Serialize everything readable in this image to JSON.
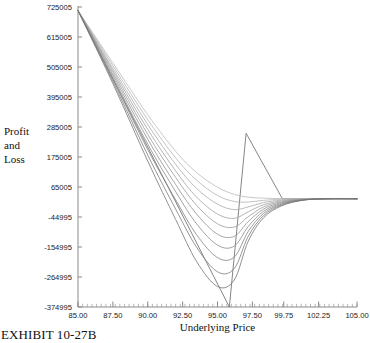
{
  "figure": {
    "exhibit_label": "EXHIBIT 10-27B"
  },
  "chart_data": {
    "type": "line",
    "title": "",
    "xlabel": "Underlying Price",
    "ylabel": "Profit and Loss",
    "ylabel_lines": [
      "Profit",
      "and",
      "Loss"
    ],
    "grid": false,
    "legend": "none",
    "xlim": [
      85.0,
      105.0
    ],
    "ylim": [
      -374995,
      725005
    ],
    "xticks": [
      85.0,
      87.5,
      90.0,
      92.5,
      95.0,
      97.5,
      99.75,
      102.25,
      105.0
    ],
    "xtick_labels": [
      "85.00",
      "87.50",
      "90.00",
      "92.50",
      "95.00",
      "97.50",
      "99.75",
      "102.25",
      "105.00"
    ],
    "yticks": [
      725005,
      615005,
      505005,
      395005,
      285005,
      175005,
      65005,
      -44995,
      -154995,
      -264995,
      -374995
    ],
    "ytick_labels": [
      "725005",
      "615005",
      "505005",
      "395005",
      "285005",
      "175005",
      "65005",
      "-44995",
      "-154995",
      "-264995",
      "-374995"
    ],
    "series": [
      {
        "name": "expiration-payoff",
        "kind": "expiration",
        "color": "#6f6f6f",
        "x": [
          85.0,
          95.85,
          97.05,
          99.65,
          105.0
        ],
        "values": [
          712000,
          -374995,
          262000,
          22000,
          22000
        ]
      },
      {
        "name": "decay-curve-1",
        "kind": "theoretical",
        "color": "#b9b9b9",
        "x": [
          85.0,
          87.5,
          90.0,
          92.0,
          93.5,
          95.0,
          96.2,
          97.2,
          98.3,
          99.6,
          101.2,
          103.0,
          105.0
        ],
        "values": [
          712000,
          520000,
          330000,
          196000,
          118000,
          64000,
          38000,
          28000,
          24000,
          22500,
          22000,
          22000,
          22000
        ]
      },
      {
        "name": "decay-curve-2",
        "kind": "theoretical",
        "color": "#b2b2b2",
        "x": [
          85.0,
          87.5,
          90.0,
          92.0,
          93.5,
          95.0,
          96.2,
          97.2,
          98.3,
          99.6,
          101.2,
          103.0,
          105.0
        ],
        "values": [
          712000,
          510000,
          312000,
          172000,
          90000,
          34000,
          12000,
          10000,
          16000,
          20000,
          21500,
          22000,
          22000
        ]
      },
      {
        "name": "decay-curve-3",
        "kind": "theoretical",
        "color": "#aaaaaa",
        "x": [
          85.0,
          87.5,
          90.0,
          92.0,
          93.5,
          95.0,
          96.2,
          97.2,
          98.3,
          99.6,
          101.2,
          103.0,
          105.0
        ],
        "values": [
          712000,
          500000,
          294000,
          148000,
          60000,
          2000,
          -18000,
          -8000,
          8000,
          17000,
          21000,
          22000,
          22000
        ]
      },
      {
        "name": "decay-curve-4",
        "kind": "theoretical",
        "color": "#a1a1a1",
        "x": [
          85.0,
          87.5,
          90.0,
          92.0,
          93.5,
          95.0,
          96.2,
          97.2,
          98.3,
          99.6,
          101.2,
          103.0,
          105.0
        ],
        "values": [
          712000,
          492000,
          276000,
          124000,
          28000,
          -34000,
          -50000,
          -26000,
          0,
          14000,
          20000,
          22000,
          22000
        ]
      },
      {
        "name": "decay-curve-5",
        "kind": "theoretical",
        "color": "#999999",
        "x": [
          85.0,
          87.5,
          90.0,
          92.0,
          93.5,
          95.0,
          96.2,
          97.2,
          98.3,
          99.6,
          101.2,
          103.0,
          105.0
        ],
        "values": [
          712000,
          484000,
          258000,
          100000,
          -2000,
          -70000,
          -82000,
          -44000,
          -8000,
          11000,
          19500,
          22000,
          22000
        ]
      },
      {
        "name": "decay-curve-6",
        "kind": "theoretical",
        "color": "#919191",
        "x": [
          85.0,
          87.5,
          90.0,
          92.0,
          93.5,
          95.0,
          96.2,
          97.2,
          98.3,
          99.6,
          101.2,
          103.0,
          105.0
        ],
        "values": [
          712000,
          476000,
          240000,
          74000,
          -34000,
          -108000,
          -116000,
          -62000,
          -16000,
          8000,
          19000,
          22000,
          22000
        ]
      },
      {
        "name": "decay-curve-7",
        "kind": "theoretical",
        "color": "#8a8a8a",
        "x": [
          85.0,
          87.5,
          90.0,
          92.0,
          93.5,
          95.0,
          96.2,
          97.2,
          98.3,
          99.6,
          101.2,
          103.0,
          105.0
        ],
        "values": [
          712000,
          468000,
          222000,
          48000,
          -70000,
          -148000,
          -152000,
          -80000,
          -24000,
          5000,
          18500,
          22000,
          22000
        ]
      },
      {
        "name": "decay-curve-8",
        "kind": "theoretical",
        "color": "#828282",
        "x": [
          85.0,
          87.5,
          90.0,
          92.0,
          93.5,
          95.0,
          96.2,
          97.2,
          98.3,
          99.6,
          101.2,
          103.0,
          105.0
        ],
        "values": [
          712000,
          460000,
          202000,
          18000,
          -110000,
          -194000,
          -192000,
          -98000,
          -32000,
          2000,
          18000,
          22000,
          22000
        ]
      },
      {
        "name": "decay-curve-9",
        "kind": "theoretical",
        "color": "#7b7b7b",
        "x": [
          85.0,
          87.5,
          90.0,
          92.0,
          93.5,
          95.0,
          96.2,
          97.2,
          98.3,
          99.6,
          101.2,
          103.0,
          105.0
        ],
        "values": [
          712000,
          452000,
          182000,
          -16000,
          -156000,
          -246000,
          -234000,
          -116000,
          -40000,
          -1000,
          17500,
          22000,
          22000
        ]
      },
      {
        "name": "decay-curve-10",
        "kind": "theoretical",
        "color": "#747474",
        "x": [
          85.0,
          87.5,
          90.0,
          92.0,
          93.5,
          95.0,
          96.2,
          97.2,
          98.3,
          99.6,
          101.2,
          103.0,
          105.0
        ],
        "values": [
          712000,
          444000,
          160000,
          -54000,
          -208000,
          -300000,
          -276000,
          -134000,
          -48000,
          -4000,
          17000,
          22000,
          22000
        ]
      }
    ]
  }
}
